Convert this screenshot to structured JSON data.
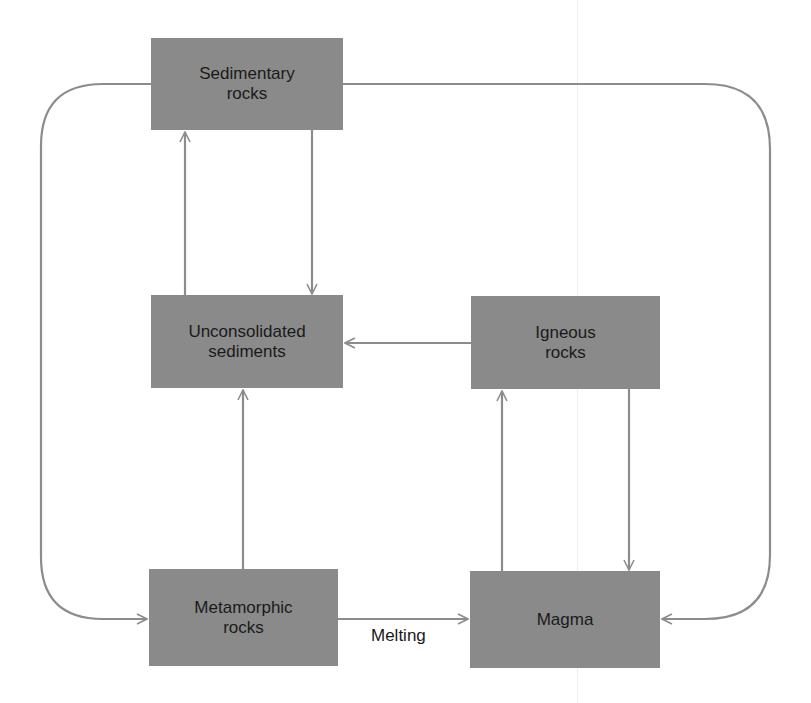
{
  "diagram": {
    "colors": {
      "box_fill": "#8a8a8a",
      "arrow": "#8c8c8c",
      "text": "#1a1a1a"
    },
    "nodes": [
      {
        "id": "sedimentary",
        "label": "Sedimentary\nrocks"
      },
      {
        "id": "unconsolidated",
        "label": "Unconsolidated\nsediments"
      },
      {
        "id": "igneous",
        "label": "Igneous\nrocks"
      },
      {
        "id": "metamorphic",
        "label": "Metamorphic\nrocks"
      },
      {
        "id": "magma",
        "label": "Magma"
      }
    ],
    "edges": [
      {
        "from": "unconsolidated",
        "to": "sedimentary",
        "label": ""
      },
      {
        "from": "sedimentary",
        "to": "unconsolidated",
        "label": ""
      },
      {
        "from": "igneous",
        "to": "unconsolidated",
        "label": ""
      },
      {
        "from": "metamorphic",
        "to": "unconsolidated",
        "label": ""
      },
      {
        "from": "magma",
        "to": "igneous",
        "label": ""
      },
      {
        "from": "igneous",
        "to": "magma",
        "label": ""
      },
      {
        "from": "metamorphic",
        "to": "magma",
        "label": "Melting"
      },
      {
        "from": "sedimentary",
        "to": "metamorphic",
        "label": ""
      },
      {
        "from": "sedimentary",
        "to": "magma",
        "label": ""
      }
    ],
    "edge_labels": {
      "melting": "Melting"
    }
  }
}
